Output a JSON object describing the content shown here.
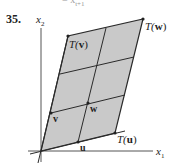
{
  "header_fragment": "= x",
  "header_subscript": "t+1",
  "problem_number": "35.",
  "axes": {
    "x1": "x",
    "x1_sub": "1",
    "x2": "x",
    "x2_sub": "2"
  },
  "vectors": {
    "u": "u",
    "v": "v",
    "w": "w",
    "Tu": {
      "fn": "T(",
      "arg": "u",
      "close": ")"
    },
    "Tv": {
      "fn": "T(",
      "arg": "v",
      "close": ")"
    },
    "Tw": {
      "fn": "T(",
      "arg": "w",
      "close": ")"
    }
  },
  "colors": {
    "fill": "#c9c9c9",
    "line": "#2a2a2a",
    "axis": "#555555"
  },
  "geometry": {
    "origin": [
      41,
      151
    ],
    "Tu": [
      115,
      133
    ],
    "Tv": [
      68,
      36
    ],
    "Tw": [
      143,
      19
    ],
    "u": [
      78,
      142
    ],
    "v": [
      51,
      113
    ],
    "w": [
      88,
      103
    ]
  }
}
